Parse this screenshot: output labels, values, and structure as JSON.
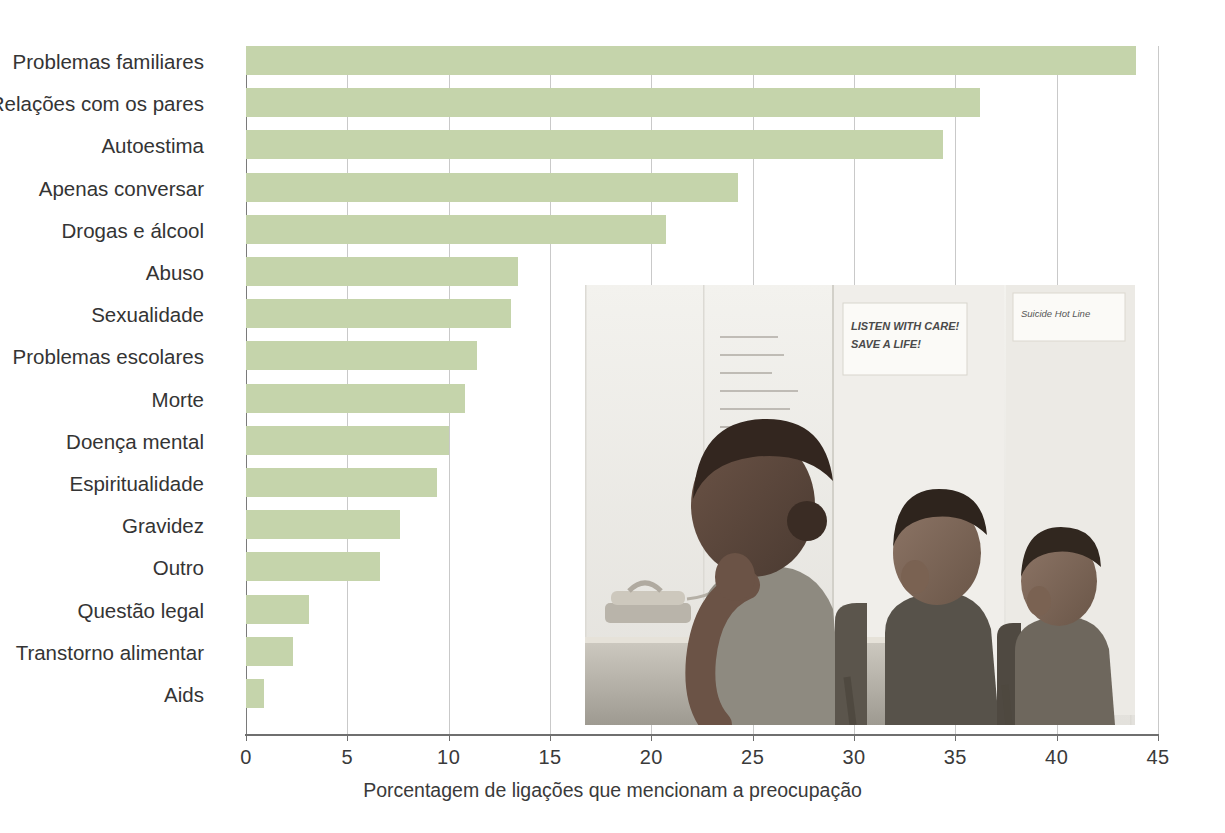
{
  "chart_data": {
    "type": "bar",
    "orientation": "horizontal",
    "title": "",
    "subtitle": "",
    "xlabel": "Porcentagem de ligações que mencionam a preocupação",
    "ylabel": "",
    "xlim": [
      0,
      45
    ],
    "xticks": [
      0,
      5,
      10,
      15,
      20,
      25,
      30,
      35,
      40,
      45
    ],
    "xtick_labels": [
      "0",
      "5",
      "10",
      "15",
      "20",
      "25",
      "30",
      "35",
      "40",
      "45"
    ],
    "grid": "vertical",
    "legend": null,
    "bar_color": "#c5d4ab",
    "categories": [
      "Problemas familiares",
      "Relações com os pares",
      "Autoestima",
      "Apenas conversar",
      "Drogas e álcool",
      "Abuso",
      "Sexualidade",
      "Problemas escolares",
      "Morte",
      "Doença mental",
      "Espiritualidade",
      "Gravidez",
      "Outro",
      "Questão legal",
      "Transtorno alimentar",
      "Aids"
    ],
    "values": [
      43.9,
      36.2,
      34.4,
      24.3,
      20.7,
      13.4,
      13.1,
      11.4,
      10.8,
      10.0,
      9.4,
      7.6,
      6.6,
      3.1,
      2.3,
      0.9
    ]
  },
  "axis": {
    "x_title": "Porcentagem de ligações que mencionam a preocupação"
  },
  "photo": {
    "caption_posters": [
      "LISTEN WITH CARE!",
      "SAVE A LIFE!",
      "Suicide Hot Line"
    ],
    "poster_note_lines": [
      "There, your yes",
      "others are names",
      "hear  from  you,",
      "And drugs these change",
      "Lets sound feel it",
      "We",
      "G",
      "R"
    ]
  }
}
